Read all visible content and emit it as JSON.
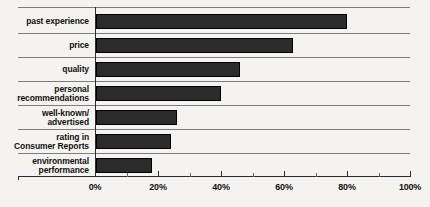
{
  "chart_data": {
    "type": "bar",
    "orientation": "horizontal",
    "title": "",
    "subtitle": "",
    "xlabel": "",
    "ylabel": "",
    "categories": [
      "past experience",
      "price",
      "quality",
      "personal recommendations",
      "well-known/ advertised",
      "rating in Consumer Reports",
      "environmental performance"
    ],
    "category_lines": [
      [
        "past experience"
      ],
      [
        "price"
      ],
      [
        "quality"
      ],
      [
        "personal",
        "recommendations"
      ],
      [
        "well-known/",
        "advertised"
      ],
      [
        "rating in",
        "Consumer Reports"
      ],
      [
        "environmental",
        "performance"
      ]
    ],
    "values": [
      80,
      63,
      46,
      40,
      26,
      24,
      18
    ],
    "xlim": [
      0,
      100
    ],
    "xticks": [
      0,
      20,
      40,
      60,
      80,
      100
    ],
    "xtick_labels": [
      "0%",
      "20%",
      "40%",
      "60%",
      "80%",
      "100%"
    ],
    "minor_xticks": [
      10,
      30,
      50,
      70,
      90
    ],
    "grid": false,
    "legend": false,
    "bar_color": "#2b2b2b",
    "axis_color": "#2c2c2c",
    "rule_color": "#7d7d7d",
    "background_color": "#f4f3f0"
  }
}
